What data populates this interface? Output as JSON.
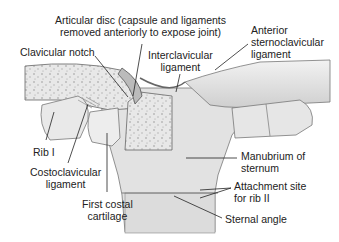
{
  "figure": {
    "labels": {
      "articular_disc_1": "Articular disc (capsule and ligaments",
      "articular_disc_2": "removed anteriorly to expose joint)",
      "clavicular_notch": "Clavicular notch",
      "interclavicular_1": "Interclavicular",
      "interclavicular_2": "ligament",
      "anterior_1": "Anterior",
      "anterior_2": "sternoclavicular",
      "anterior_3": "ligament",
      "rib1": "Rib I",
      "costoclavicular_1": "Costoclavicular",
      "costoclavicular_2": "ligament",
      "first_costal_1": "First costal",
      "first_costal_2": "cartilage",
      "manubrium_1": "Manubrium of",
      "manubrium_2": "sternum",
      "attachment_1": "Attachment site",
      "attachment_2": "for rib II",
      "sternal_angle": "Sternal angle"
    },
    "colors": {
      "bone": "#e4e4e4",
      "bone_dark": "#c9c9c9",
      "outline": "#555555",
      "text": "#222222"
    }
  }
}
